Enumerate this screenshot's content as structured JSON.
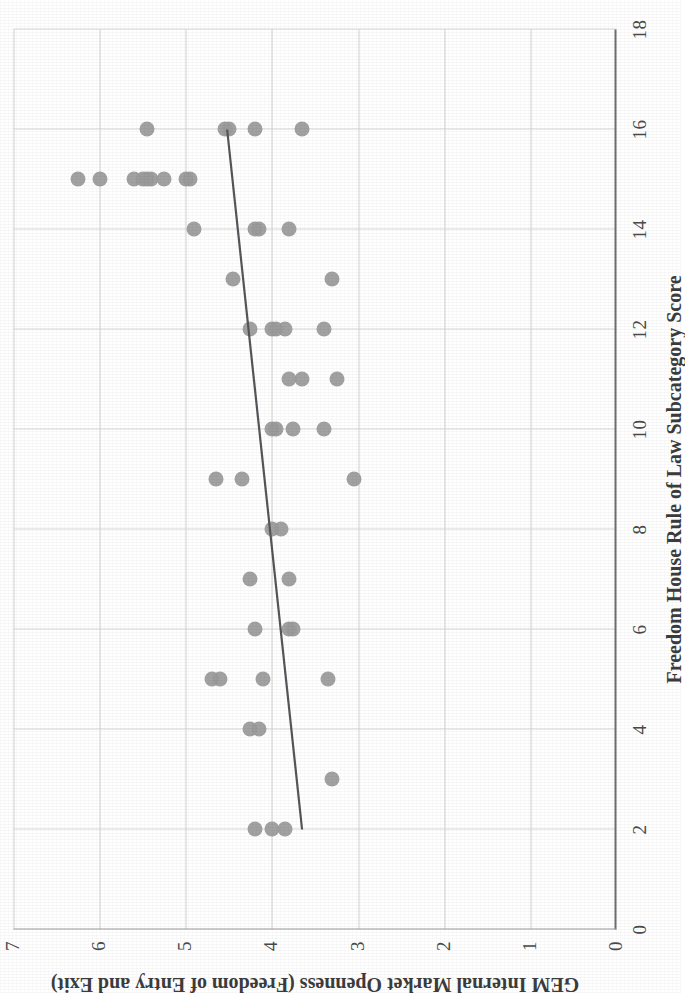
{
  "figure": {
    "kind": "scatter-plot",
    "orientation": "rotated-90-counterclockwise",
    "marker_color": "#9a9a9a",
    "trendline_color": "#55565a",
    "gridline_color": "#d5d5d5",
    "axis_color": "#7d7d7d"
  },
  "chart_data": {
    "type": "scatter",
    "title": "",
    "xlabel": "Freedom House Rule of Law Subcategory Score",
    "ylabel": "GEM Internal Market Openness (Freedom of  Entry and Exit)",
    "xlim": [
      0,
      18
    ],
    "ylim": [
      0,
      7
    ],
    "xticks": [
      0,
      2,
      4,
      6,
      8,
      10,
      12,
      14,
      16,
      18
    ],
    "yticks": [
      0,
      1,
      2,
      3,
      4,
      5,
      6,
      7
    ],
    "xtick_labels": [
      "0",
      "2",
      "4",
      "6",
      "8",
      "10",
      "12",
      "14",
      "16",
      "18"
    ],
    "ytick_labels": [
      "0",
      "1",
      "2",
      "3",
      "4",
      "5",
      "6",
      "7"
    ],
    "grid": true,
    "legend": null,
    "series": [
      {
        "name": "Countries",
        "marker": "circle",
        "color": "#9a9a9a",
        "points": [
          [
            2,
            4.2
          ],
          [
            2,
            4.0
          ],
          [
            2,
            3.85
          ],
          [
            3,
            3.3
          ],
          [
            4,
            4.25
          ],
          [
            4,
            4.15
          ],
          [
            5,
            4.7
          ],
          [
            5,
            4.6
          ],
          [
            5,
            4.1
          ],
          [
            5,
            3.35
          ],
          [
            6,
            4.2
          ],
          [
            6,
            3.8
          ],
          [
            6,
            3.75
          ],
          [
            7,
            4.25
          ],
          [
            7,
            3.8
          ],
          [
            8,
            4.0
          ],
          [
            8,
            3.9
          ],
          [
            9,
            4.65
          ],
          [
            9,
            4.35
          ],
          [
            9,
            3.05
          ],
          [
            10,
            4.0
          ],
          [
            10,
            3.95
          ],
          [
            10,
            3.75
          ],
          [
            10,
            3.4
          ],
          [
            11,
            3.8
          ],
          [
            11,
            3.65
          ],
          [
            11,
            3.25
          ],
          [
            12,
            4.25
          ],
          [
            12,
            4.0
          ],
          [
            12,
            3.95
          ],
          [
            12,
            3.85
          ],
          [
            12,
            3.4
          ],
          [
            13,
            4.45
          ],
          [
            13,
            3.3
          ],
          [
            14,
            4.9
          ],
          [
            14,
            4.2
          ],
          [
            14,
            4.15
          ],
          [
            14,
            3.8
          ],
          [
            15,
            6.25
          ],
          [
            15,
            6.0
          ],
          [
            15,
            5.6
          ],
          [
            15,
            5.5
          ],
          [
            15,
            5.45
          ],
          [
            15,
            5.4
          ],
          [
            15,
            5.25
          ],
          [
            15,
            5.0
          ],
          [
            15,
            4.95
          ],
          [
            16,
            5.45
          ],
          [
            16,
            4.55
          ],
          [
            16,
            4.5
          ],
          [
            16,
            4.2
          ],
          [
            16,
            3.65
          ]
        ]
      }
    ],
    "trendline": {
      "type": "linear-fit",
      "from": [
        2,
        3.65
      ],
      "to": [
        16,
        4.52
      ],
      "color": "#55565a"
    }
  }
}
